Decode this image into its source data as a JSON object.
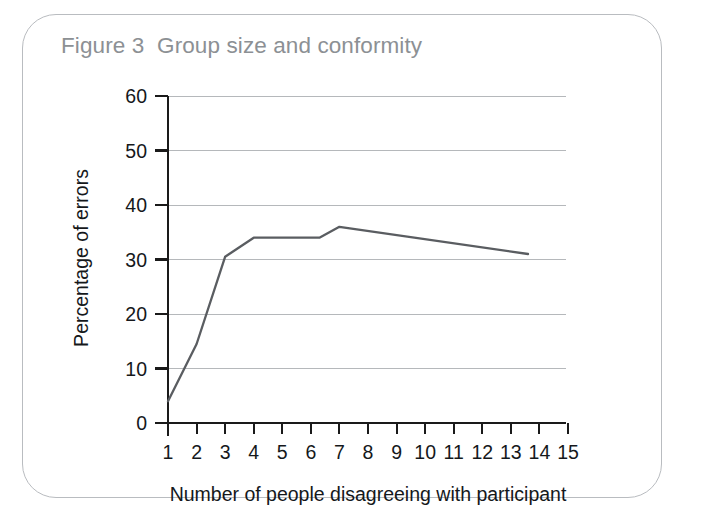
{
  "figure": {
    "title": "Figure 3  Group size and conformity",
    "title_color": "#8c9094",
    "border_color": "#b9bcc0"
  },
  "chart_data": {
    "type": "line",
    "title": "Figure 3  Group size and conformity",
    "xlabel": "Number of people disagreeing with participant",
    "ylabel": "Percentage of errors",
    "x": [
      1,
      2,
      3,
      4,
      6.3,
      7,
      13.6
    ],
    "values": [
      4,
      14.5,
      30.5,
      34,
      34,
      36,
      31
    ],
    "xlim": [
      1,
      15
    ],
    "ylim": [
      0,
      60
    ],
    "xticks": [
      1,
      2,
      3,
      4,
      5,
      6,
      7,
      8,
      9,
      10,
      11,
      12,
      13,
      14,
      15
    ],
    "xtick_labels": [
      "1",
      "2",
      "3",
      "4",
      "5",
      "6",
      "7",
      "8",
      "9",
      "10",
      "11",
      "12",
      "13",
      "14",
      "15"
    ],
    "yticks": [
      0,
      10,
      20,
      30,
      40,
      50,
      60
    ],
    "ytick_labels": [
      "0",
      "10",
      "20",
      "30",
      "40",
      "50",
      "60"
    ],
    "grid": true,
    "grid_color": "#b5b8bb",
    "line_color": "#5a5d61",
    "legend": null,
    "series": [
      {
        "name": "Percentage of errors",
        "points": [
          {
            "x": 1,
            "y": 4
          },
          {
            "x": 2,
            "y": 14.5
          },
          {
            "x": 3,
            "y": 30.5
          },
          {
            "x": 4,
            "y": 34
          },
          {
            "x": 6.3,
            "y": 34
          },
          {
            "x": 7,
            "y": 36
          },
          {
            "x": 13.6,
            "y": 31
          }
        ]
      }
    ]
  }
}
